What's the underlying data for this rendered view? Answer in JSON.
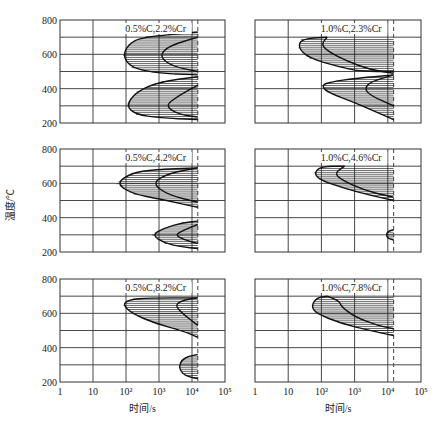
{
  "figure": {
    "ylabel": "温度/℃",
    "xlabel": "时间/s",
    "caption": "",
    "yticks": [
      "800",
      "600",
      "400",
      "200"
    ],
    "xticks": [
      "1",
      "10",
      "10²",
      "10³",
      "10⁴",
      "10⁵"
    ]
  },
  "chart_data": [
    {
      "type": "line",
      "title": "0.5%C,2.2%Cr",
      "xlabel": "时间/s",
      "ylabel": "温度/℃",
      "xscale": "log",
      "xlim": [
        1,
        100000
      ],
      "ylim": [
        200,
        800
      ],
      "grid": true,
      "dashed_line_x": 15000,
      "regions": [
        {
          "name": "pearlite",
          "start_nose": {
            "time": 80,
            "temp": 590
          },
          "finish_nose": {
            "time": 1000,
            "temp": 590
          },
          "temp_range": [
            480,
            730
          ]
        },
        {
          "name": "bainite",
          "start_nose": {
            "time": 100,
            "temp": 300
          },
          "finish_nose": {
            "time": 1500,
            "temp": 300
          },
          "temp_range": [
            220,
            480
          ]
        }
      ]
    },
    {
      "type": "line",
      "title": "1.0%C,2.3%Cr",
      "xlabel": "时间/s",
      "ylabel": "温度/℃",
      "xscale": "log",
      "xlim": [
        1,
        100000
      ],
      "ylim": [
        200,
        800
      ],
      "grid": true,
      "dashed_line_x": 15000,
      "regions": [
        {
          "name": "pearlite",
          "start_nose": {
            "time": 20,
            "temp": 640
          },
          "finish_nose": {
            "time": 150,
            "temp": 640
          },
          "temp_range": [
            500,
            700
          ]
        },
        {
          "name": "bainite",
          "start_nose": {
            "time": 100,
            "temp": 420
          },
          "finish_nose": {
            "time": 2000,
            "temp": 400
          },
          "temp_range": [
            220,
            500
          ]
        }
      ]
    },
    {
      "type": "line",
      "title": "0.5%C,4.2%Cr",
      "xlabel": "时间/s",
      "ylabel": "温度/℃",
      "xscale": "log",
      "xlim": [
        1,
        100000
      ],
      "ylim": [
        200,
        800
      ],
      "grid": true,
      "dashed_line_x": 15000,
      "regions": [
        {
          "name": "pearlite",
          "start_nose": {
            "time": 50,
            "temp": 600
          },
          "finish_nose": {
            "time": 600,
            "temp": 600
          },
          "temp_range": [
            460,
            690
          ]
        },
        {
          "name": "bainite",
          "start_nose": {
            "time": 600,
            "temp": 300
          },
          "finish_nose": {
            "time": 3000,
            "temp": 300
          },
          "temp_range": [
            220,
            380
          ]
        }
      ]
    },
    {
      "type": "line",
      "title": "1.0%C,4.6%Cr",
      "xlabel": "时间/s",
      "ylabel": "温度/℃",
      "xscale": "log",
      "xlim": [
        1,
        100000
      ],
      "ylim": [
        200,
        800
      ],
      "grid": true,
      "dashed_line_x": 15000,
      "regions": [
        {
          "name": "pearlite",
          "start_nose": {
            "time": 60,
            "temp": 650
          },
          "finish_nose": {
            "time": 500,
            "temp": 650
          },
          "temp_range": [
            480,
            700
          ]
        },
        {
          "name": "bainite",
          "start_nose": {
            "time": 9000,
            "temp": 300
          },
          "finish_nose": null,
          "temp_range": [
            270,
            330
          ]
        }
      ]
    },
    {
      "type": "line",
      "title": "0.5%C,8.2%Cr",
      "xlabel": "时间/s",
      "ylabel": "温度/℃",
      "xscale": "log",
      "xlim": [
        1,
        100000
      ],
      "ylim": [
        200,
        800
      ],
      "grid": true,
      "dashed_line_x": 15000,
      "regions": [
        {
          "name": "pearlite",
          "start_nose": {
            "time": 80,
            "temp": 650
          },
          "finish_nose": {
            "time": 3000,
            "temp": 650
          },
          "temp_range": [
            460,
            690
          ]
        },
        {
          "name": "bainite",
          "start_nose": {
            "time": 5000,
            "temp": 290
          },
          "finish_nose": null,
          "temp_range": [
            220,
            360
          ]
        }
      ]
    },
    {
      "type": "line",
      "title": "1.0%C,7.8%Cr",
      "xlabel": "时间/s",
      "ylabel": "温度/℃",
      "xscale": "log",
      "xlim": [
        1,
        100000
      ],
      "ylim": [
        200,
        800
      ],
      "grid": true,
      "dashed_line_x": 15000,
      "regions": [
        {
          "name": "pearlite",
          "start_nose": {
            "time": 50,
            "temp": 640
          },
          "finish_nose": {
            "time": 400,
            "temp": 640
          },
          "temp_range": [
            470,
            700
          ]
        }
      ]
    }
  ]
}
